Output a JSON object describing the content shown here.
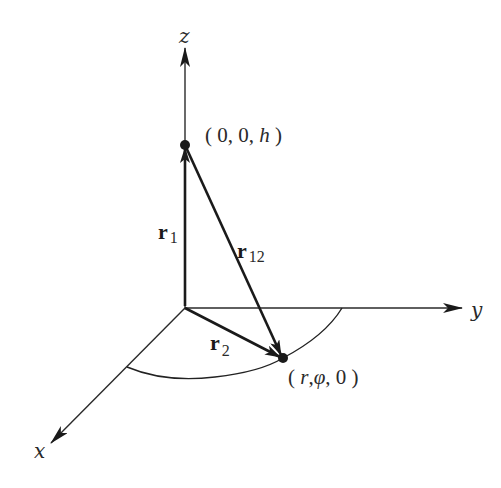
{
  "diagram": {
    "axes": {
      "x": {
        "label": "x"
      },
      "y": {
        "label": "y"
      },
      "z": {
        "label": "z"
      }
    },
    "points": {
      "top": {
        "label_open": "( 0, 0, ",
        "label_var": "h",
        "label_close": " )"
      },
      "bottom": {
        "label_open": "( ",
        "label_r": "r",
        "label_sep": ",",
        "label_phi": "φ",
        "label_close": ", 0 )"
      }
    },
    "vectors": {
      "r1": {
        "symbol": "r",
        "subscript": "1"
      },
      "r2": {
        "symbol": "r",
        "subscript": "2"
      },
      "r12": {
        "symbol": "r",
        "subscript": "12"
      }
    },
    "colors": {
      "line": "#1a1a1a",
      "background": "#ffffff"
    }
  }
}
